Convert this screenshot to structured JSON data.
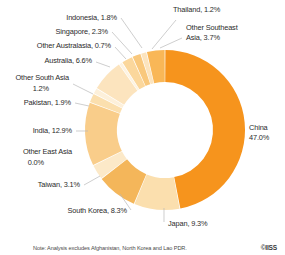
{
  "chart_data": {
    "type": "pie",
    "variant": "donut",
    "title": "",
    "xlabel": "",
    "ylabel": "",
    "legend_position": "none",
    "labels_inline": true,
    "start_angle_deg": 0,
    "direction": "clockwise",
    "categories": [
      "China",
      "Japan",
      "South Korea",
      "Taiwan",
      "Other East Asia",
      "India",
      "Pakistan",
      "Other South Asia",
      "Australia",
      "Other Australasia",
      "Singapore",
      "Indonesia",
      "Thailand",
      "Other Southeast Asia"
    ],
    "values": [
      47.0,
      9.3,
      8.3,
      3.1,
      0.0,
      12.9,
      1.9,
      1.2,
      6.6,
      0.7,
      2.3,
      1.8,
      1.2,
      3.7
    ],
    "unit": "%",
    "colors": [
      "#F6941D",
      "#FBDFAE",
      "#F4B65A",
      "#FCE9C8",
      "#FBDFAE",
      "#F9CD8A",
      "#FBDFAE",
      "#FDF0DA",
      "#FCE4BE",
      "#FDF3E2",
      "#FBD79C",
      "#F9C87C",
      "#FCE4BE",
      "#F9B757"
    ],
    "slice_labels": [
      {
        "name": "China",
        "text": "China",
        "text2": "47.0%",
        "pct": "47.0%"
      },
      {
        "name": "Japan",
        "text": "Japan, 9.3%",
        "text2": "",
        "pct": "9.3%"
      },
      {
        "name": "South Korea",
        "text": "South Korea, 8.3%",
        "text2": "",
        "pct": "8.3%"
      },
      {
        "name": "Taiwan",
        "text": "Taiwan, 3.1%",
        "text2": "",
        "pct": "3.1%"
      },
      {
        "name": "Other East Asia",
        "text": "Other East Asia",
        "text2": "0.0%",
        "pct": "0.0%"
      },
      {
        "name": "India",
        "text": "India, 12.9%",
        "text2": "",
        "pct": "12.9%"
      },
      {
        "name": "Pakistan",
        "text": "Pakistan, 1.9%",
        "text2": "",
        "pct": "1.9%"
      },
      {
        "name": "Other South Asia",
        "text": "Other South Asia",
        "text2": "1.2%",
        "pct": "1.2%"
      },
      {
        "name": "Australia",
        "text": "Australia, 6.6%",
        "text2": "",
        "pct": "6.6%"
      },
      {
        "name": "Other Australasia",
        "text": "Other Australasia, 0.7%",
        "text2": "",
        "pct": "0.7%"
      },
      {
        "name": "Singapore",
        "text": "Singapore, 2.3%",
        "text2": "",
        "pct": "2.3%"
      },
      {
        "name": "Indonesia",
        "text": "Indonesia, 1.8%",
        "text2": "",
        "pct": "1.8%"
      },
      {
        "name": "Thailand",
        "text": "Thailand, 1.2%",
        "text2": "",
        "pct": "1.2%"
      },
      {
        "name": "Other Southeast Asia",
        "text": "Other Southeast",
        "text2": "Asia, 3.7%",
        "pct": "3.7%"
      }
    ]
  },
  "footer": {
    "note": "Note: Analysis excludes Afghanistan, North Korea and Lao PDR.",
    "credit": "©IISS"
  },
  "labels": {
    "china_l1": "China",
    "china_l2": "47.0%",
    "japan": "Japan, 9.3%",
    "south_korea": "South Korea, 8.3%",
    "taiwan": "Taiwan, 3.1%",
    "other_east_asia_l1": "Other East Asia",
    "other_east_asia_l2": "0.0%",
    "india": "India, 12.9%",
    "pakistan": "Pakistan, 1.9%",
    "other_south_asia_l1": "Other South Asia",
    "other_south_asia_l2": "1.2%",
    "australia": "Australia, 6.6%",
    "other_australasia": "Other Australasia, 0.7%",
    "singapore": "Singapore, 2.3%",
    "indonesia": "Indonesia, 1.8%",
    "thailand": "Thailand, 1.2%",
    "other_southeast_asia_l1": "Other Southeast",
    "other_southeast_asia_l2": "Asia, 3.7%"
  }
}
